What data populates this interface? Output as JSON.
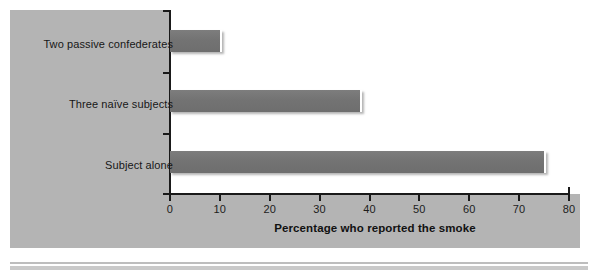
{
  "chart_data": {
    "type": "bar",
    "orientation": "horizontal",
    "title": "",
    "subtitle": "",
    "categories": [
      "Two passive confederates",
      "Three naïve subjects",
      "Subject alone"
    ],
    "values": [
      10,
      38,
      75
    ],
    "xlabel": "Percentage who reported the smoke",
    "ylabel": "",
    "xlim": [
      0,
      80
    ],
    "xticks": [
      0,
      10,
      20,
      30,
      40,
      50,
      60,
      70,
      80
    ],
    "xtick_labels": [
      "0",
      "10",
      "20",
      "30",
      "40",
      "50",
      "60",
      "70",
      "80"
    ],
    "grid": false,
    "legend": null,
    "annotations": [],
    "series": [
      {
        "name": "Percentage who reported the smoke",
        "values": [
          10,
          38,
          75
        ]
      }
    ]
  },
  "figure": {
    "panel_color": "#b4b4b4",
    "plot_background": "#ffffff",
    "bar_color": "#737373",
    "axis_color": "#1a1a1a",
    "text_color": "#171717"
  },
  "axis": {
    "title": "Percentage who reported the smoke",
    "ticks": [
      {
        "value": "0"
      },
      {
        "value": "10"
      },
      {
        "value": "20"
      },
      {
        "value": "30"
      },
      {
        "value": "40"
      },
      {
        "value": "50"
      },
      {
        "value": "60"
      },
      {
        "value": "70"
      },
      {
        "value": "80"
      }
    ]
  },
  "bars": [
    {
      "label": "Two passive confederates",
      "value": 10
    },
    {
      "label": "Three naïve subjects",
      "value": 38
    },
    {
      "label": "Subject alone",
      "value": 75
    }
  ]
}
